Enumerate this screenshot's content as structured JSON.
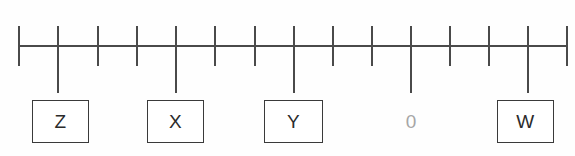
{
  "figure": {
    "type": "number-line",
    "title": "",
    "background_color": "#fefefe",
    "line_color": "#4a4a4a",
    "box_border_color": "#3a3a3a",
    "box_text_color": "#2b2b2b",
    "plain_label_color": "#a6a6a6"
  },
  "chart_data": {
    "type": "scatter",
    "title": "",
    "xlabel": "",
    "ylabel": "",
    "grid": false,
    "legend": null,
    "axis": {
      "orientation": "horizontal",
      "x_start_px": 19,
      "x_end_px": 567,
      "y_px": 46,
      "tick_count": 15,
      "tick_spacing_px": 39.14,
      "tick_positions_px": [
        19,
        58,
        98,
        137,
        176,
        215,
        255,
        294,
        333,
        372,
        411,
        450,
        489,
        528,
        567
      ],
      "tick_indices": [
        0,
        1,
        2,
        3,
        4,
        5,
        6,
        7,
        8,
        9,
        10,
        11,
        12,
        13,
        14
      ],
      "short_tick_top_px": 26,
      "short_tick_bottom_px": 66,
      "long_tick_bottom_px": 93
    },
    "points": [
      {
        "label": "Z",
        "tick_index": 1,
        "x_px": 58,
        "boxed": true,
        "long_tick": true
      },
      {
        "label": "X",
        "tick_index": 4,
        "x_px": 176,
        "boxed": true,
        "long_tick": true
      },
      {
        "label": "Y",
        "tick_index": 7,
        "x_px": 294,
        "boxed": true,
        "long_tick": true
      },
      {
        "label": "0",
        "tick_index": 10,
        "x_px": 411,
        "boxed": false,
        "long_tick": true
      },
      {
        "label": "W",
        "tick_index": 13,
        "x_px": 528,
        "boxed": true,
        "long_tick": true
      }
    ],
    "labels": [
      "Z",
      "X",
      "Y",
      "0",
      "W"
    ],
    "values": [
      1,
      4,
      7,
      10,
      13
    ]
  },
  "boxes": [
    {
      "name": "z-label-box",
      "text": "Z",
      "left_px": 32,
      "top_px": 100,
      "width_px": 57,
      "height_px": 43
    },
    {
      "name": "x-label-box",
      "text": "X",
      "left_px": 147,
      "top_px": 100,
      "width_px": 57,
      "height_px": 43
    },
    {
      "name": "y-label-box",
      "text": "Y",
      "left_px": 264,
      "top_px": 100,
      "width_px": 59,
      "height_px": 43
    },
    {
      "name": "w-label-box",
      "text": "W",
      "left_px": 497,
      "top_px": 100,
      "width_px": 57,
      "height_px": 43
    }
  ],
  "plain_labels": [
    {
      "name": "zero-label",
      "text": "0",
      "left_px": 396,
      "top_px": 100,
      "width_px": 30,
      "height_px": 43
    }
  ]
}
